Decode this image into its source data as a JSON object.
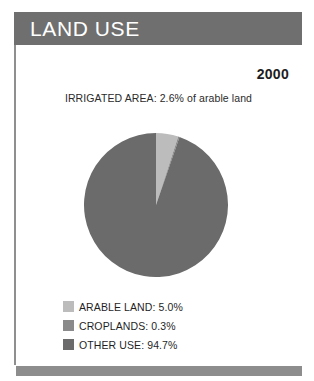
{
  "header": {
    "title": "LAND USE",
    "bar_color": "#6f6f6f",
    "text_color": "#ffffff"
  },
  "year": "2000",
  "irrigated_note": "IRRIGATED AREA: 2.6% of arable land",
  "legend": [
    {
      "label": "ARABLE LAND: 5.0%",
      "color": "#bcbcbc",
      "swatch_name": "legend-swatch-arable-land"
    },
    {
      "label": "CROPLANDS: 0.3%",
      "color": "#8a8a8a",
      "swatch_name": "legend-swatch-croplands"
    },
    {
      "label": "OTHER USE: 94.7%",
      "color": "#6b6b6b",
      "swatch_name": "legend-swatch-other-use"
    }
  ],
  "chart_data": {
    "type": "pie",
    "title": "LAND USE",
    "subtitle": "IRRIGATED AREA: 2.6% of arable land",
    "year": "2000",
    "categories": [
      "ARABLE LAND",
      "CROPLANDS",
      "OTHER USE"
    ],
    "values": [
      5.0,
      0.3,
      94.7
    ],
    "value_unit": "%",
    "colors": [
      "#bcbcbc",
      "#8a8a8a",
      "#6b6b6b"
    ],
    "labels": [
      "ARABLE LAND: 5.0%",
      "CROPLANDS: 0.3%",
      "OTHER USE: 94.7%"
    ],
    "start_angle_deg": 90,
    "direction": "counterclockwise",
    "legend_position": "bottom",
    "grid": false,
    "center": [
      156,
      205
    ],
    "radius": 72
  }
}
